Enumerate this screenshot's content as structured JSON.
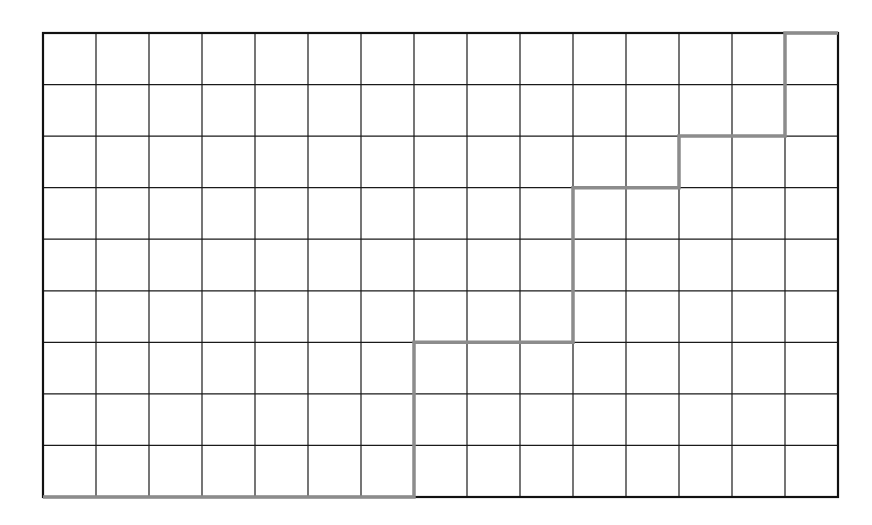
{
  "diagram": {
    "type": "grid-path",
    "columns": 15,
    "rows": 9,
    "bounds": {
      "left": 43,
      "top": 33,
      "right": 838,
      "bottom": 497
    },
    "grid_color": "#1a1a1a",
    "border_color": "#111111",
    "path_color": "#8c8c8c",
    "path_points": [
      [
        0,
        9
      ],
      [
        7,
        9
      ],
      [
        7,
        6
      ],
      [
        10,
        6
      ],
      [
        10,
        3
      ],
      [
        12,
        3
      ],
      [
        12,
        2
      ],
      [
        14,
        2
      ],
      [
        14,
        0
      ],
      [
        15,
        0
      ]
    ]
  }
}
